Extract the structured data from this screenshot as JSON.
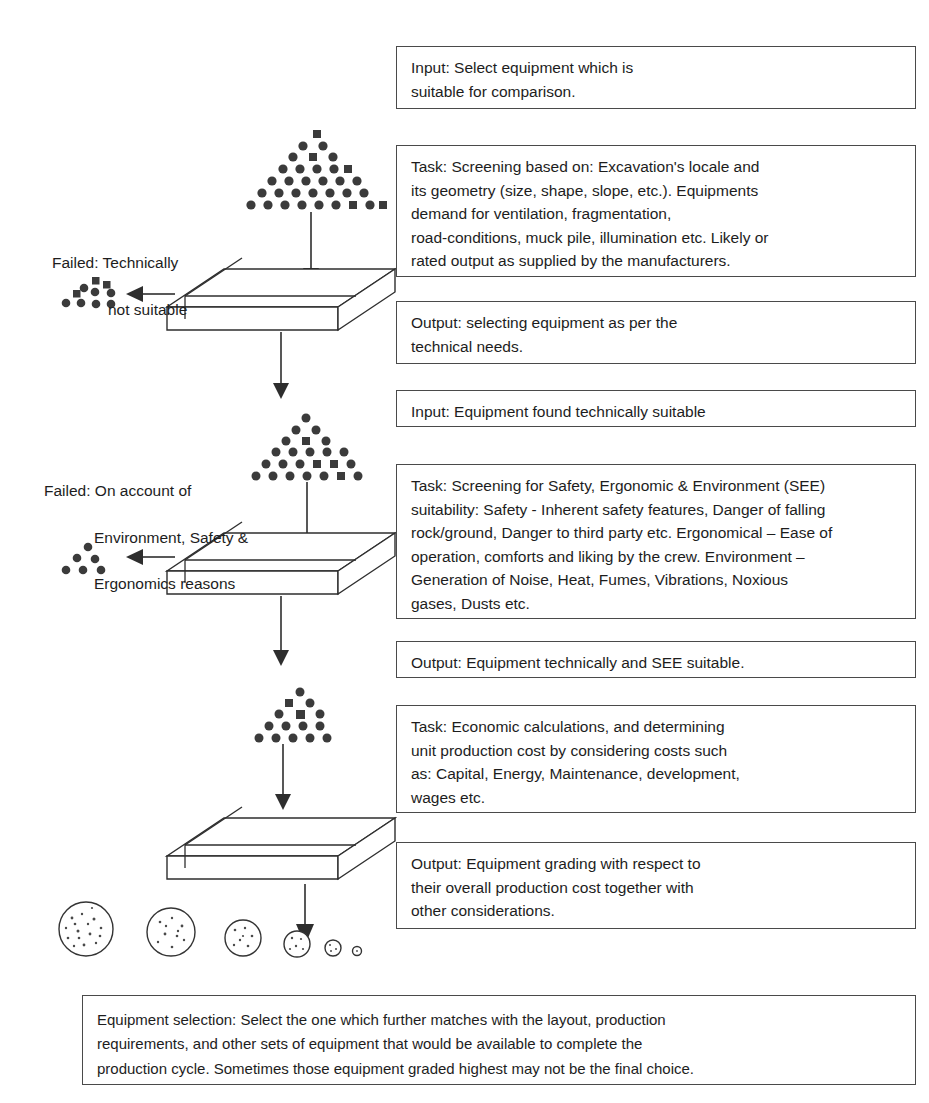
{
  "diagram": {
    "boxes": [
      {
        "id": "input-1",
        "name": "input-select-equipment-box",
        "text": "Input: Select equipment which is\nsuitable for comparison."
      },
      {
        "id": "task-1",
        "name": "task-technical-screening-box",
        "text": "Task: Screening based on: Excavation's locale and\nits geometry (size, shape, slope, etc.). Equipments\ndemand for ventilation, fragmentation,\nroad-conditions, muck pile, illumination etc. Likely or\nrated output as supplied by the manufacturers."
      },
      {
        "id": "output-1",
        "name": "output-technical-needs-box",
        "text": "Output: selecting equipment as per the\ntechnical needs."
      },
      {
        "id": "input-2",
        "name": "input-technically-suitable-box",
        "text": "Input: Equipment found technically suitable"
      },
      {
        "id": "task-2",
        "name": "task-see-screening-box",
        "text": "Task: Screening for Safety, Ergonomic & Environment (SEE)\nsuitability: Safety - Inherent safety features, Danger of falling\nrock/ground, Danger to third party etc. Ergonomical – Ease of\noperation, comforts and liking by the crew. Environment –\nGeneration of Noise, Heat, Fumes, Vibrations, Noxious\ngases, Dusts etc."
      },
      {
        "id": "output-2",
        "name": "output-see-suitable-box",
        "text": "Output: Equipment technically and SEE suitable."
      },
      {
        "id": "task-3",
        "name": "task-economic-calculations-box",
        "text": "Task: Economic calculations, and determining\nunit production cost by considering costs such\nas: Capital, Energy, Maintenance, development,\nwages etc."
      },
      {
        "id": "output-3",
        "name": "output-equipment-grading-box",
        "text": "Output: Equipment grading with respect to\ntheir overall production cost together with\nother considerations."
      },
      {
        "id": "final",
        "name": "equipment-selection-summary-box",
        "text": "Equipment selection: Select the one which further matches with the layout, production\nrequirements, and other sets of equipment that would be available  to complete the\nproduction cycle. Sometimes those equipment graded highest may not be the final choice."
      }
    ],
    "side_labels": [
      {
        "id": "failed-1",
        "name": "failed-technically-not-suitable-label",
        "line1": "Failed: Technically",
        "line2": "not suitable",
        "line3": ""
      },
      {
        "id": "failed-2",
        "name": "failed-see-reasons-label",
        "line1": "Failed: On account of",
        "line2": "Environment, Safety &",
        "line3": "Ergonomics reasons"
      }
    ],
    "icons": {
      "pyramid_cluster": "equipment-population-pyramid-icon",
      "reject_cluster": "rejected-equipment-cluster-icon",
      "sieve_slab": "screening-sieve-slab-icon",
      "down_arrow": "down-arrow-icon",
      "left_arrow": "left-arrow-icon",
      "rock_row": "graded-equipment-rocks-icon"
    },
    "colors": {
      "ink": "#1d1d1d",
      "stroke": "#2e2e2e",
      "dot": "#3b3b3b",
      "background": "#ffffff"
    }
  }
}
